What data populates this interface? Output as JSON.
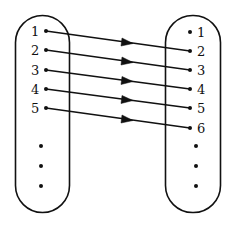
{
  "diagram": {
    "type": "mapping",
    "left_set": {
      "labels": [
        "1",
        "2",
        "3",
        "4",
        "5"
      ],
      "ellipsis_dots": 3
    },
    "right_set": {
      "labels": [
        "1",
        "2",
        "3",
        "4",
        "5",
        "6"
      ],
      "ellipsis_dots": 3
    },
    "mappings": [
      {
        "from": "1",
        "to": "2"
      },
      {
        "from": "2",
        "to": "3"
      },
      {
        "from": "3",
        "to": "4"
      },
      {
        "from": "4",
        "to": "5"
      },
      {
        "from": "5",
        "to": "6"
      }
    ],
    "colors": {
      "stroke": "#111111",
      "background": "#ffffff"
    }
  }
}
